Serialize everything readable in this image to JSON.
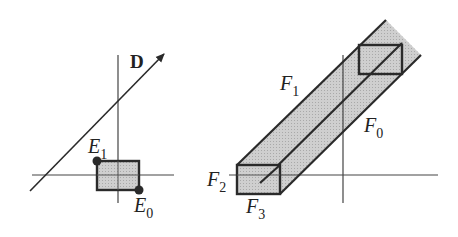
{
  "left_panel": {
    "direction_label": "D",
    "points": [
      {
        "name": "E",
        "sub": "1"
      },
      {
        "name": "E",
        "sub": "0"
      }
    ]
  },
  "right_panel": {
    "faces": [
      {
        "name": "F",
        "sub": "1"
      },
      {
        "name": "F",
        "sub": "0"
      },
      {
        "name": "F",
        "sub": "2"
      },
      {
        "name": "F",
        "sub": "3"
      }
    ]
  },
  "colors": {
    "line": "#2a2a2a",
    "fill": "#c8c8c8",
    "background": "#ffffff"
  }
}
